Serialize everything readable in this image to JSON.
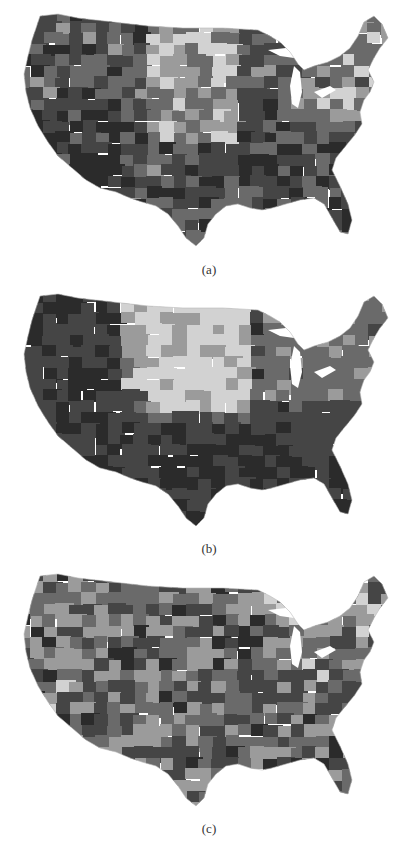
{
  "figure": {
    "panels": [
      {
        "label": "(a)",
        "description": "Choropleth map of contiguous United States regions, grayscale shading",
        "palette": [
          "#2b2b2b",
          "#4a4a4a",
          "#6e6e6e",
          "#9a9a9a",
          "#d0d0d0"
        ],
        "pattern": "mixed-west-dark-plains-light"
      },
      {
        "label": "(b)",
        "description": "Choropleth map of contiguous United States regions, grayscale shading",
        "palette": [
          "#2b2b2b",
          "#4a4a4a",
          "#6e6e6e",
          "#9a9a9a",
          "#d0d0d0"
        ],
        "pattern": "north-plains-light-south-dark"
      },
      {
        "label": "(c)",
        "description": "Choropleth map of contiguous United States regions, grayscale shading",
        "palette": [
          "#2b2b2b",
          "#4a4a4a",
          "#6e6e6e",
          "#9a9a9a",
          "#d0d0d0"
        ],
        "pattern": "mixed-scattered"
      }
    ]
  }
}
